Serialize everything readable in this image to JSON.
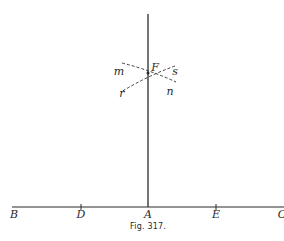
{
  "figure": {
    "caption": "Fig. 317.",
    "ink_color": "#2a2a2a",
    "background": "#ffffff"
  },
  "geometry": {
    "base_line": {
      "x1": 12,
      "y1": 207,
      "x2": 284,
      "y2": 207
    },
    "perpendicular": {
      "x1": 148,
      "y1": 14,
      "x2": 148,
      "y2": 207
    },
    "ticks_x": [
      81,
      148,
      216
    ],
    "arc_lines": [
      {
        "from": "m",
        "x1": 122,
        "y1": 64,
        "x2": 176,
        "y2": 81
      },
      {
        "from": "s",
        "x1": 174,
        "y1": 66,
        "x2": 120,
        "y2": 92
      }
    ]
  },
  "labels": {
    "B": "B",
    "D": "D",
    "A": "A",
    "E": "E",
    "C": "C",
    "F": "F",
    "m": "m",
    "s": "s",
    "r": "r",
    "n": "n"
  }
}
